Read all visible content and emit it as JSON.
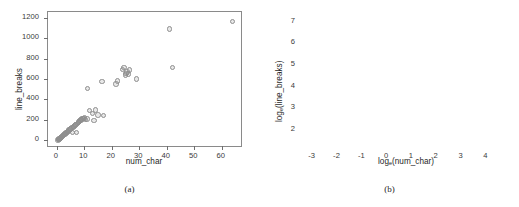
{
  "figure": {
    "panels": [
      {
        "id": "a",
        "caption": "(a)",
        "xlabel": "num_char",
        "ylabel": "line_breaks"
      },
      {
        "id": "b",
        "caption": "(b)",
        "xlabel_prefix": "log",
        "xlabel_sub": "e",
        "xlabel_suffix": "(num_char)",
        "ylabel_prefix": "log",
        "ylabel_sub": "e",
        "ylabel_suffix": "(line_breaks)"
      }
    ],
    "marker_color": "#8e8e8e",
    "frame_color": "#8a8a8a",
    "background": "#ffffff"
  },
  "chart_data": [
    {
      "type": "scatter",
      "panel": "a",
      "title": "",
      "xlabel": "num_char",
      "ylabel": "line_breaks",
      "xlim": [
        -3.2,
        67.0
      ],
      "ylim": [
        -55,
        1255
      ],
      "xticks": [
        0,
        10,
        20,
        30,
        40,
        50,
        60
      ],
      "yticks": [
        0,
        200,
        400,
        600,
        800,
        1000,
        1200
      ],
      "grid": false,
      "legend": null,
      "x": [
        0.4,
        0.6,
        0.7,
        0.8,
        0.9,
        1.0,
        1.1,
        1.2,
        1.3,
        1.4,
        1.5,
        1.6,
        1.8,
        2.0,
        2.2,
        2.4,
        2.6,
        2.8,
        3.0,
        3.2,
        3.4,
        3.6,
        3.8,
        4.0,
        4.2,
        4.5,
        4.8,
        5.0,
        5.2,
        5.5,
        5.8,
        6.0,
        6.2,
        6.5,
        6.8,
        7.0,
        7.2,
        7.5,
        7.8,
        8.0,
        8.2,
        8.5,
        8.8,
        9.0,
        9.2,
        9.5,
        9.8,
        10.0,
        10.5,
        11.0,
        11.2,
        12.0,
        13.0,
        13.5,
        14.0,
        15.0,
        16.5,
        17.0,
        21.5,
        22.0,
        24.0,
        24.5,
        25.0,
        25.2,
        25.5,
        26.0,
        26.5,
        29.0,
        41.0,
        42.0,
        64.0
      ],
      "y": [
        5,
        8,
        10,
        12,
        14,
        16,
        18,
        20,
        22,
        25,
        28,
        30,
        35,
        40,
        45,
        50,
        55,
        60,
        62,
        68,
        72,
        78,
        82,
        88,
        92,
        100,
        108,
        112,
        118,
        125,
        78,
        130,
        138,
        145,
        150,
        158,
        80,
        165,
        172,
        178,
        185,
        192,
        198,
        205,
        210,
        212,
        215,
        218,
        205,
        208,
        508,
        290,
        262,
        192,
        298,
        248,
        578,
        246,
        552,
        580,
        692,
        712,
        640,
        655,
        668,
        648,
        688,
        602,
        1088,
        715,
        1162
      ]
    },
    {
      "type": "scatter",
      "panel": "b",
      "title": "",
      "xlabel": "log_e(num_char)",
      "ylabel": "log_e(line_breaks)",
      "xlim": [
        -3.35,
        4.55
      ],
      "ylim": [
        1.25,
        7.45
      ],
      "xticks": [
        -3,
        -2,
        -1,
        0,
        1,
        2,
        3,
        4
      ],
      "yticks": [
        2,
        3,
        4,
        5,
        6,
        7
      ],
      "grid": false,
      "legend": null,
      "x": [
        -2.9,
        -2.45,
        -2.05,
        -0.9,
        -0.85,
        -0.8,
        -0.5,
        -0.42,
        -0.38,
        0.12,
        0.3,
        0.38,
        0.92,
        0.95,
        1.0,
        1.05,
        1.12,
        1.45,
        1.5,
        1.6,
        1.65,
        1.7,
        1.72,
        1.75,
        1.8,
        1.85,
        1.88,
        1.92,
        1.95,
        2.0,
        2.05,
        2.1,
        2.15,
        2.18,
        2.2,
        2.22,
        2.25,
        2.28,
        2.3,
        2.32,
        2.35,
        2.38,
        2.4,
        2.45,
        2.5,
        2.55,
        2.6,
        2.62,
        2.65,
        2.7,
        2.75,
        2.8,
        3.0,
        3.1,
        3.15,
        3.18,
        3.2,
        3.22,
        3.25,
        3.28,
        3.3,
        3.35,
        3.45,
        3.7,
        3.78,
        4.08,
        4.18
      ],
      "y": [
        1.6,
        1.6,
        1.6,
        2.58,
        2.55,
        3.2,
        3.35,
        2.85,
        2.82,
        3.56,
        3.58,
        3.55,
        4.1,
        4.12,
        4.15,
        4.18,
        3.8,
        4.6,
        4.12,
        4.22,
        4.2,
        4.25,
        4.45,
        4.4,
        4.85,
        4.88,
        4.82,
        4.42,
        4.45,
        5.0,
        5.02,
        4.98,
        5.25,
        5.3,
        5.35,
        5.38,
        5.32,
        5.36,
        5.4,
        5.42,
        5.34,
        5.38,
        5.6,
        5.45,
        5.5,
        5.7,
        5.52,
        5.48,
        6.28,
        5.72,
        5.5,
        5.52,
        6.4,
        6.42,
        6.5,
        6.52,
        6.55,
        6.48,
        6.45,
        6.5,
        6.52,
        6.46,
        6.6,
        6.62,
        7.02,
        7.08,
        7.1
      ]
    }
  ]
}
